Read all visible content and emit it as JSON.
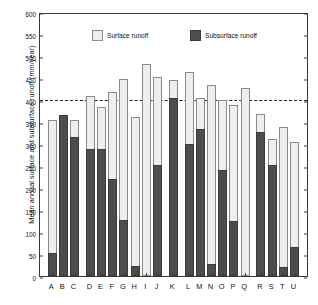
{
  "chart_data": {
    "type": "bar",
    "title": "",
    "subtitle": "",
    "xlabel": "",
    "ylabel": "Mean annual surface and subsurface runoff (mm/year)",
    "ylim": [
      0,
      600
    ],
    "ytick_step": 50,
    "yticks": [
      0,
      50,
      100,
      150,
      200,
      250,
      300,
      350,
      400,
      450,
      500,
      550,
      600
    ],
    "grid": false,
    "legend_position": "top-inside",
    "stacked": true,
    "categories": [
      "A",
      "B",
      "C",
      "D",
      "E",
      "F",
      "G",
      "H",
      "I",
      "J",
      "K",
      "L",
      "M",
      "N",
      "O",
      "P",
      "Q",
      "R",
      "S",
      "T",
      "U"
    ],
    "series": [
      {
        "name": "Subsurface runoff",
        "color": "#4d4d4d",
        "values": [
          52,
          365,
          316,
          289,
          288,
          221,
          127,
          23,
          0,
          252,
          404,
          300,
          335,
          28,
          242,
          124,
          0,
          328,
          253,
          21,
          66
        ]
      },
      {
        "name": "Surface runoff",
        "color": "#eeeeec",
        "values": [
          303,
          0,
          39,
          120,
          97,
          197,
          321,
          339,
          481,
          200,
          42,
          163,
          69,
          405,
          158,
          265,
          427,
          41,
          59,
          317,
          239
        ]
      }
    ],
    "totals": [
      355,
      365,
      355,
      409,
      385,
      418,
      448,
      362,
      481,
      452,
      446,
      463,
      404,
      433,
      400,
      389,
      427,
      369,
      312,
      338,
      305
    ],
    "annotations": [
      {
        "type": "hline",
        "value": 405,
        "style": "dashed",
        "color": "#222222"
      }
    ],
    "group_breaks_after": [
      "C",
      "J",
      "K",
      "Q"
    ]
  },
  "legend": {
    "entries": [
      {
        "label": "Surface runoff",
        "swatch": "light-square-icon"
      },
      {
        "label": "Subsurface runoff",
        "swatch": "dark-square-icon"
      }
    ]
  },
  "axes": {
    "y_title": "Mean annual surface and subsurface runoff (mm/year)",
    "y_tick_labels": [
      "0",
      "50",
      "100",
      "150",
      "200",
      "250",
      "300",
      "350",
      "400",
      "450",
      "500",
      "550",
      "600"
    ],
    "x_tick_labels": [
      "A",
      "B",
      "C",
      "D",
      "E",
      "F",
      "G",
      "H",
      "I",
      "J",
      "K",
      "L",
      "M",
      "N",
      "O",
      "P",
      "Q",
      "R",
      "S",
      "T",
      "U"
    ]
  }
}
